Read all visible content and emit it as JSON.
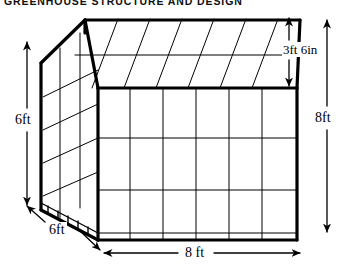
{
  "figure": {
    "title": "GREENHOUSE STRUCTURE AND DESIGN",
    "subject": "greenhouse",
    "style": "line-drawing",
    "background_color": "#ffffff",
    "line_color": "#000000"
  },
  "dimensions": {
    "wall_height": {
      "label": "6ft",
      "name": "side-wall-height",
      "position": "left",
      "arrow": "double-vertical"
    },
    "roof_rise": {
      "label": "3ft 6in",
      "name": "roof-rise",
      "position": "upper-right",
      "arrow": "double-vertical"
    },
    "total_height": {
      "label": "8ft",
      "name": "overall-height",
      "position": "far-right",
      "arrow": "double-vertical"
    },
    "depth": {
      "label": "6ft",
      "name": "building-depth",
      "position": "bottom-left",
      "arrow": "double-diagonal"
    },
    "width": {
      "label": "8 ft",
      "name": "building-width",
      "position": "bottom",
      "arrow": "double-horizontal"
    }
  },
  "structure": {
    "front_face": {
      "columns": 6,
      "rows": 3
    },
    "roof_slope": {
      "bays": 6,
      "purlins": 1
    },
    "gable_end": {
      "columns": 2,
      "rows": 4
    },
    "foundation": "hatched-base-strip"
  }
}
